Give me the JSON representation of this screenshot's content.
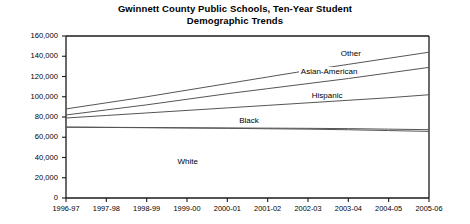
{
  "chart_data": {
    "type": "line",
    "title": "Gwinnett County Public Schools, Ten-Year Student Demographic Trends",
    "title_lines": [
      "Gwinnett County Public Schools, Ten-Year Student",
      "Demographic Trends"
    ],
    "xlabel": "",
    "ylabel": "",
    "grid": false,
    "legend_position": "inline-right",
    "ylim": [
      0,
      160000
    ],
    "yticks": [
      0,
      20000,
      40000,
      60000,
      80000,
      100000,
      120000,
      140000,
      160000
    ],
    "ytick_labels": [
      "0",
      "20,000",
      "40,000",
      "60,000",
      "80,000",
      "100,000",
      "120,000",
      "140,000",
      "160,000"
    ],
    "categories": [
      "1996-97",
      "1997-98",
      "1998-99",
      "1999-00",
      "2000-01",
      "2001-02",
      "2002-03",
      "2003-04",
      "2004-05",
      "2005-06"
    ],
    "series": [
      {
        "name": "Other",
        "label": "Other",
        "color": "#555555",
        "values": [
          88000,
          94000,
          100000,
          106500,
          113000,
          119500,
          126000,
          132000,
          138000,
          144000
        ]
      },
      {
        "name": "Asian-American",
        "label": "Asian-American",
        "color": "#555555",
        "values": [
          82000,
          87000,
          92000,
          97500,
          103000,
          108000,
          113000,
          118000,
          123500,
          129000
        ]
      },
      {
        "name": "Hispanic",
        "label": "Hispanic",
        "color": "#555555",
        "values": [
          79000,
          81500,
          84000,
          86500,
          89000,
          91500,
          94000,
          96500,
          99000,
          102000
        ]
      },
      {
        "name": "Black",
        "label": "Black",
        "color": "#555555",
        "values": [
          70000,
          69800,
          69600,
          69400,
          69200,
          69000,
          68800,
          68500,
          68000,
          67500
        ]
      },
      {
        "name": "White",
        "label": "White",
        "color": "#555555",
        "values": [
          70000,
          69700,
          69400,
          69100,
          68800,
          68400,
          68000,
          67400,
          66600,
          65800
        ]
      }
    ],
    "inline_labels": [
      {
        "text": "Other",
        "x_pct": 83.0,
        "y_value": 142000
      },
      {
        "text": "Asian-American",
        "x_pct": 72.0,
        "y_value": 124000
      },
      {
        "text": "Hispanic",
        "x_pct": 75.0,
        "y_value": 101000
      },
      {
        "text": "Black",
        "x_pct": 55.0,
        "y_value": 76000
      },
      {
        "text": "White",
        "x_pct": 38.0,
        "y_value": 36000
      }
    ]
  }
}
